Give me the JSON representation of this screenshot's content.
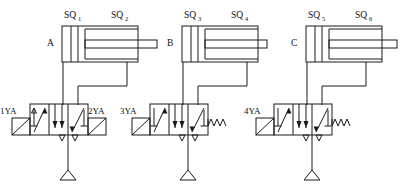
{
  "diagram": {
    "type": "hydraulic-pneumatic-schematic",
    "line_color": "#1a1a1a",
    "background_color": "#ffffff",
    "groups": [
      {
        "cylinder_label": "A",
        "limit_switch_left": "SQ",
        "limit_switch_left_sub": "1",
        "limit_switch_right": "SQ",
        "limit_switch_right_sub": "2",
        "solenoid_left": "1YA",
        "solenoid_right": "2YA",
        "valve_type": "3-position 4-way double solenoid, spring centered",
        "return_element": "solenoid"
      },
      {
        "cylinder_label": "B",
        "limit_switch_left": "SQ",
        "limit_switch_left_sub": "3",
        "limit_switch_right": "SQ",
        "limit_switch_right_sub": "4",
        "solenoid_left": "3YA",
        "solenoid_right": "",
        "valve_type": "3-position 4-way single solenoid, spring return",
        "return_element": "spring"
      },
      {
        "cylinder_label": "C",
        "limit_switch_left": "SQ",
        "limit_switch_left_sub": "5",
        "limit_switch_right": "SQ",
        "limit_switch_right_sub": "6",
        "solenoid_left": "4YA",
        "solenoid_right": "",
        "valve_type": "3-position 4-way single solenoid, spring return",
        "return_element": "spring"
      }
    ],
    "source_symbol": "pressure-source-triangle",
    "source_count": 3
  }
}
